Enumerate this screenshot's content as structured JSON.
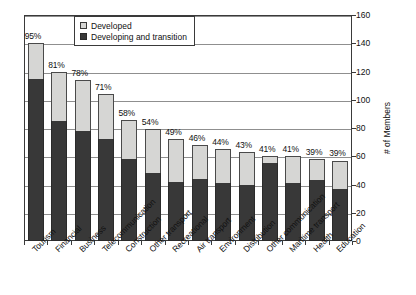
{
  "chart_data": {
    "type": "bar",
    "stacked": true,
    "title": "",
    "subtitle": "",
    "xlabel": "",
    "ylabel": "# of Members",
    "ylim": [
      0,
      160
    ],
    "ytick_step": 20,
    "yticks": [
      "0",
      "20",
      "40",
      "60",
      "80",
      "100",
      "120",
      "140",
      "160"
    ],
    "grid": true,
    "legend_position": "top-center",
    "categories": [
      "Tourism",
      "Financial",
      "Business",
      "Telecommunication",
      "Construction",
      "Other transport",
      "Recreational",
      "Air transport",
      "Environment",
      "Distribution",
      "Other communication",
      "Maritime transport",
      "Health",
      "Education"
    ],
    "series": [
      {
        "name": "Developing and transition",
        "color": "#383838",
        "values": [
          115,
          85,
          78,
          72,
          58,
          48,
          42,
          44,
          41,
          40,
          55,
          41,
          43,
          37
        ]
      },
      {
        "name": "Developed",
        "color": "#d6d6d4",
        "values": [
          25,
          35,
          36,
          32,
          28,
          31,
          30,
          24,
          24,
          23,
          5,
          19,
          15,
          20
        ]
      }
    ],
    "totals": [
      140,
      120,
      114,
      104,
      86,
      79,
      72,
      68,
      65,
      63,
      60,
      60,
      58,
      57
    ],
    "data_labels": [
      "95%",
      "81%",
      "78%",
      "71%",
      "58%",
      "54%",
      "49%",
      "46%",
      "44%",
      "43%",
      "41%",
      "41%",
      "39%",
      "39%"
    ]
  },
  "legend": {
    "items": [
      {
        "label": "Developed",
        "swatch": "developed"
      },
      {
        "label": "Developing and transition",
        "swatch": "developing"
      }
    ]
  }
}
